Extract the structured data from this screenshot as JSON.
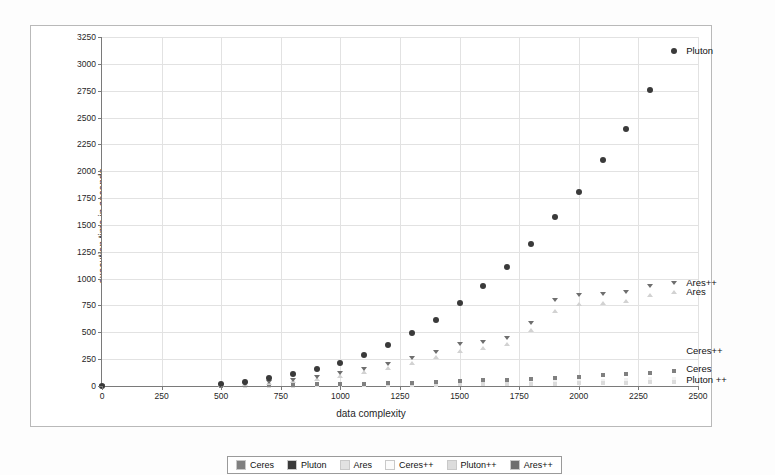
{
  "chart_data": {
    "type": "scatter",
    "title": "",
    "xlabel": "data complexity",
    "ylabel": "execution time in seconde",
    "xlim": [
      0,
      2500
    ],
    "ylim": [
      0,
      3250
    ],
    "xticks": [
      0,
      250,
      500,
      750,
      1000,
      1250,
      1500,
      1750,
      2000,
      2250,
      2500
    ],
    "yticks": [
      0,
      250,
      500,
      750,
      1000,
      1250,
      1500,
      1750,
      2000,
      2250,
      2500,
      2750,
      3000,
      3250
    ],
    "grid": true,
    "legend_position": "bottom",
    "series": [
      {
        "name": "Ceres",
        "color": "#808080",
        "marker": "square",
        "x": [
          0,
          500,
          600,
          700,
          800,
          900,
          1000,
          1100,
          1200,
          1300,
          1400,
          1500,
          1600,
          1700,
          1800,
          1900,
          2000,
          2100,
          2200,
          2300,
          2400
        ],
        "y": [
          0,
          4,
          6,
          8,
          11,
          14,
          18,
          22,
          27,
          32,
          38,
          45,
          52,
          60,
          68,
          78,
          88,
          99,
          111,
          124,
          138
        ]
      },
      {
        "name": "Pluton",
        "color": "#3a3a3a",
        "marker": "circle",
        "x": [
          0,
          500,
          600,
          700,
          800,
          900,
          1000,
          1100,
          1200,
          1300,
          1400,
          1500,
          1600,
          1700,
          1800,
          1900,
          2000,
          2100,
          2200,
          2300,
          2400
        ],
        "y": [
          0,
          20,
          40,
          70,
          110,
          160,
          215,
          290,
          380,
          490,
          615,
          770,
          930,
          1110,
          1320,
          1570,
          1810,
          2100,
          2390,
          2760,
          3120
        ]
      },
      {
        "name": "Ares",
        "color": "#d2d2d2",
        "marker": "triangle-up",
        "x": [
          0,
          500,
          600,
          700,
          800,
          900,
          1000,
          1100,
          1200,
          1300,
          1400,
          1500,
          1600,
          1700,
          1800,
          1900,
          2000,
          2100,
          2200,
          2300,
          2400
        ],
        "y": [
          0,
          8,
          16,
          28,
          45,
          68,
          96,
          128,
          168,
          215,
          268,
          330,
          355,
          390,
          520,
          700,
          760,
          770,
          790,
          850,
          880
        ]
      },
      {
        "name": "Ceres++",
        "color": "#f2f2f2",
        "marker": "square",
        "x": [
          0,
          500,
          600,
          700,
          800,
          900,
          1000,
          1100,
          1200,
          1300,
          1400,
          1500,
          1600,
          1700,
          1800,
          1900,
          2000,
          2100,
          2200,
          2300,
          2400
        ],
        "y": [
          0,
          2,
          3,
          4,
          5,
          7,
          9,
          11,
          13,
          16,
          19,
          22,
          26,
          30,
          34,
          39,
          44,
          50,
          56,
          62,
          69
        ]
      },
      {
        "name": "Pluton++",
        "color": "#dcdcdc",
        "marker": "square",
        "x": [
          0,
          500,
          600,
          700,
          800,
          900,
          1000,
          1100,
          1200,
          1300,
          1400,
          1500,
          1600,
          1700,
          1800,
          1900,
          2000,
          2100,
          2200,
          2300,
          2400
        ],
        "y": [
          0,
          1,
          2,
          3,
          4,
          5,
          6,
          7,
          9,
          10,
          12,
          14,
          16,
          18,
          21,
          23,
          26,
          29,
          32,
          36,
          40
        ]
      },
      {
        "name": "Ares++",
        "color": "#6e6e6e",
        "marker": "triangle-down",
        "x": [
          0,
          500,
          600,
          700,
          800,
          900,
          1000,
          1100,
          1200,
          1300,
          1400,
          1500,
          1600,
          1700,
          1800,
          1900,
          2000,
          2100,
          2200,
          2300,
          2400
        ],
        "y": [
          0,
          10,
          20,
          35,
          58,
          85,
          120,
          160,
          205,
          260,
          320,
          390,
          410,
          450,
          590,
          800,
          850,
          860,
          875,
          930,
          960
        ]
      }
    ],
    "annotations": [
      {
        "text": "Pluton",
        "x": 2400,
        "y": 3120,
        "dx": 12,
        "dy": 0
      },
      {
        "text": "Ares++",
        "x": 2400,
        "y": 960,
        "dx": 12,
        "dy": 0
      },
      {
        "text": "Ares",
        "x": 2400,
        "y": 880,
        "dx": 12,
        "dy": 0
      },
      {
        "text": "Ceres++",
        "x": 2400,
        "y": 330,
        "dx": 12,
        "dy": 0
      },
      {
        "text": "Ceres",
        "x": 2400,
        "y": 160,
        "dx": 12,
        "dy": 0
      },
      {
        "text": "Pluton ++",
        "x": 2400,
        "y": 55,
        "dx": 12,
        "dy": 0
      }
    ]
  },
  "legend": {
    "items": [
      {
        "label": "Ceres",
        "color": "#808080"
      },
      {
        "label": "Pluton",
        "color": "#3a3a3a"
      },
      {
        "label": "Ares",
        "color": "#e2e2e2"
      },
      {
        "label": "Ceres++",
        "color": "#fbfbfb"
      },
      {
        "label": "Pluton++",
        "color": "#dcdcdc"
      },
      {
        "label": "Ares++",
        "color": "#6e6e6e"
      }
    ]
  }
}
